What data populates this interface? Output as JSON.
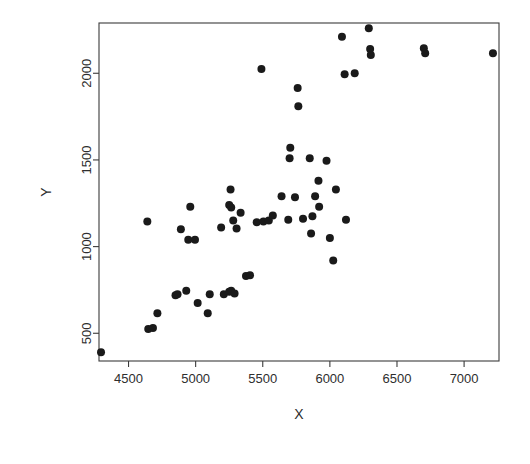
{
  "figure": {
    "width": 530,
    "height": 464,
    "background_color": "#ffffff",
    "point_color": "#1a1a1a",
    "axis_color": "#3b3b3b",
    "frame": {
      "left": 99,
      "right": 499,
      "top": 23,
      "bottom": 361
    }
  },
  "chart_data": {
    "type": "scatter",
    "title": "",
    "xlabel": "X",
    "ylabel": "Y",
    "xlim": [
      4280,
      7260
    ],
    "ylim": [
      340,
      2290
    ],
    "xticks": [
      4500,
      5000,
      5500,
      6000,
      6500,
      7000
    ],
    "yticks": [
      500,
      1000,
      1500,
      2000
    ],
    "xticklabels": [
      "4500",
      "5000",
      "5500",
      "6000",
      "6500",
      "7000"
    ],
    "yticklabels": [
      "500",
      "1000",
      "1500",
      "2000"
    ],
    "grid": false,
    "legend": null,
    "marker": "filled-circle",
    "marker_size": 4,
    "n_points": 68,
    "points": [
      [
        4295,
        390
      ],
      [
        4647,
        525
      ],
      [
        4682,
        530
      ],
      [
        4715,
        615
      ],
      [
        4640,
        1145
      ],
      [
        4850,
        720
      ],
      [
        4865,
        725
      ],
      [
        4930,
        745
      ],
      [
        4890,
        1100
      ],
      [
        4945,
        1040
      ],
      [
        4995,
        1040
      ],
      [
        4960,
        1230
      ],
      [
        5015,
        675
      ],
      [
        5090,
        615
      ],
      [
        5105,
        725
      ],
      [
        5210,
        725
      ],
      [
        5250,
        740
      ],
      [
        5265,
        745
      ],
      [
        5290,
        730
      ],
      [
        5375,
        830
      ],
      [
        5405,
        835
      ],
      [
        5190,
        1110
      ],
      [
        5250,
        1240
      ],
      [
        5265,
        1225
      ],
      [
        5260,
        1330
      ],
      [
        5280,
        1150
      ],
      [
        5305,
        1105
      ],
      [
        5335,
        1195
      ],
      [
        5455,
        1140
      ],
      [
        5490,
        2025
      ],
      [
        5505,
        1145
      ],
      [
        5545,
        1150
      ],
      [
        5575,
        1180
      ],
      [
        5640,
        1290
      ],
      [
        5690,
        1155
      ],
      [
        5700,
        1510
      ],
      [
        5705,
        1570
      ],
      [
        5740,
        1285
      ],
      [
        5760,
        1915
      ],
      [
        5765,
        1810
      ],
      [
        5800,
        1160
      ],
      [
        5850,
        1510
      ],
      [
        5860,
        1075
      ],
      [
        5870,
        1175
      ],
      [
        5890,
        1290
      ],
      [
        5915,
        1380
      ],
      [
        5920,
        1230
      ],
      [
        5975,
        1495
      ],
      [
        6000,
        1050
      ],
      [
        6025,
        920
      ],
      [
        6045,
        1330
      ],
      [
        6090,
        2210
      ],
      [
        6110,
        1995
      ],
      [
        6120,
        1155
      ],
      [
        6185,
        2000
      ],
      [
        6290,
        2260
      ],
      [
        6300,
        2140
      ],
      [
        6305,
        2105
      ],
      [
        6700,
        2145
      ],
      [
        6710,
        2115
      ],
      [
        7215,
        2115
      ]
    ]
  },
  "axis_labels": {
    "x_title": "X",
    "y_title": "Y"
  }
}
